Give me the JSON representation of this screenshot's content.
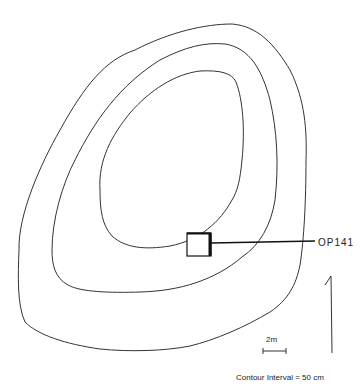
{
  "map": {
    "title": "Topographic contour map",
    "operation_label": "OP141",
    "scale_label": "2m",
    "contour_interval_label": "Contour Interval = 50 cm",
    "north_arrow": "north-arrow",
    "contours": [
      {
        "name": "outer",
        "path": "M 19 250 C 18 215, 40 165, 60 130 C 85 85, 105 60, 135 50 C 170 32, 205 24, 232 24 C 258 26, 275 45, 290 70 C 305 100, 307 130, 306 160 C 306 200, 304 240, 300 265 C 296 285, 288 300, 270 312 C 245 327, 215 340, 190 346 C 165 351, 130 352, 100 349 C 65 344, 38 335, 25 322 C 17 305, 18 275, 19 250 Z"
      },
      {
        "name": "middle",
        "path": "M 52 250 C 52 220, 62 185, 75 160 C 95 120, 120 85, 160 60 C 185 47, 205 42, 225 44 C 250 48, 262 70, 270 100 C 277 130, 279 165, 275 200 C 271 225, 260 245, 242 257 C 215 280, 180 291, 140 292 C 110 293, 80 292, 68 285 C 55 278, 52 265, 52 250 Z"
      },
      {
        "name": "inner",
        "path": "M 100 190 C 98 160, 112 135, 130 113 C 150 90, 175 74, 200 71 C 220 70, 232 73, 236 82 C 243 100, 245 130, 242 160 C 240 180, 238 190, 232 200 C 220 222, 200 240, 170 246 C 145 250, 125 248, 112 236 C 102 225, 100 210, 100 190 Z"
      }
    ]
  },
  "style": {
    "line_color": "#333333",
    "background": "#ffffff"
  }
}
